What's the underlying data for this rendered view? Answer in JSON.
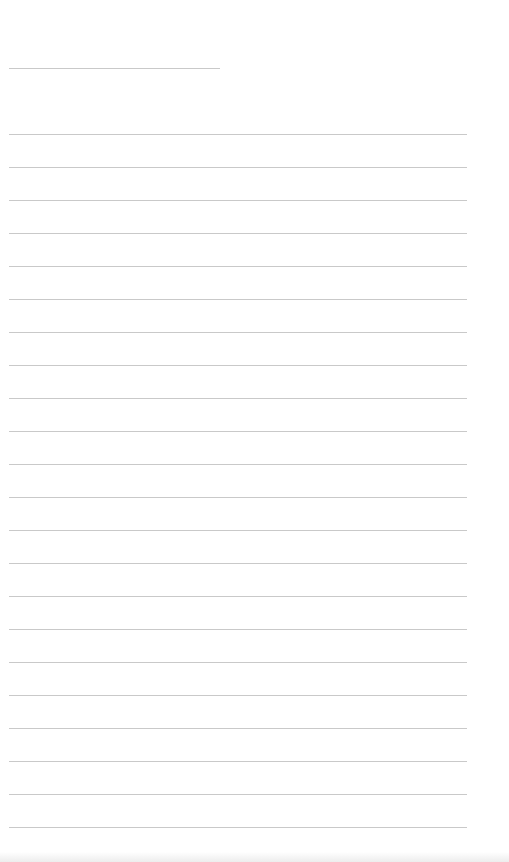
{
  "document": {
    "type": "blank lined sheet",
    "text": "",
    "rule_color": "#c9c9c9",
    "background": "#ffffff",
    "title_line": {
      "y": 68,
      "x": 9,
      "width": 211
    },
    "lines": {
      "start_y": 134,
      "spacing": 33,
      "count": 22,
      "x": 9,
      "width": 458
    }
  }
}
